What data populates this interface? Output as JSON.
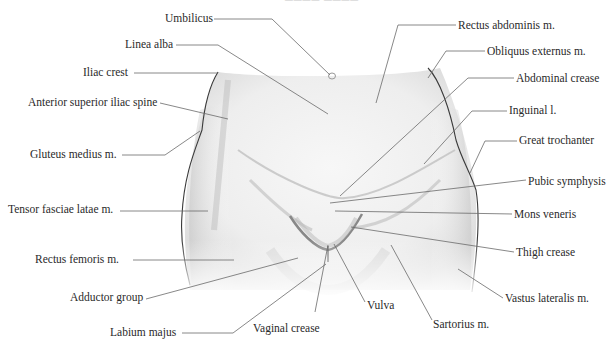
{
  "diagram": {
    "title_fragment": "──── ────",
    "colors": {
      "line": "#6a6a6a",
      "text": "#2a2a2a",
      "outline": "#3a3a3a",
      "shade": "#9a9a9a"
    },
    "labels": [
      {
        "id": "umbilicus",
        "text": "Umbilicus",
        "x": 165,
        "y": 12,
        "align": "r",
        "w": 47,
        "line": [
          [
            214,
            19
          ],
          [
            272,
            19
          ],
          [
            330,
            75
          ]
        ]
      },
      {
        "id": "linea-alba",
        "text": "Linea alba",
        "x": 125,
        "y": 38,
        "align": "r",
        "w": 50,
        "line": [
          [
            176,
            45
          ],
          [
            218,
            45
          ],
          [
            328,
            114
          ]
        ]
      },
      {
        "id": "iliac-crest",
        "text": "Iliac crest",
        "x": 83,
        "y": 66,
        "align": "r",
        "w": 45,
        "line": [
          [
            134,
            73
          ],
          [
            218,
            73
          ]
        ]
      },
      {
        "id": "asis",
        "text": "Anterior superior iliac spine",
        "x": 28,
        "y": 96,
        "align": "r",
        "w": 130,
        "line": [
          [
            160,
            103
          ],
          [
            228,
            119
          ]
        ]
      },
      {
        "id": "gluteus-medius",
        "text": "Gluteus medius m.",
        "x": 30,
        "y": 148,
        "align": "r",
        "w": 88,
        "line": [
          [
            122,
            155
          ],
          [
            165,
            155
          ],
          [
            200,
            131
          ]
        ]
      },
      {
        "id": "tensor-fasciae-latae",
        "text": "Tensor fasciae latae m.",
        "x": 8,
        "y": 203,
        "align": "r",
        "w": 108,
        "line": [
          [
            120,
            211
          ],
          [
            208,
            211
          ]
        ]
      },
      {
        "id": "rectus-femoris",
        "text": "Rectus femoris m.",
        "x": 35,
        "y": 253,
        "align": "r",
        "w": 85,
        "line": [
          [
            133,
            260
          ],
          [
            234,
            260
          ]
        ]
      },
      {
        "id": "adductor-group",
        "text": "Adductor group",
        "x": 70,
        "y": 291,
        "align": "r",
        "w": 75,
        "line": [
          [
            146,
            299
          ],
          [
            298,
            258
          ]
        ]
      },
      {
        "id": "labium-majus",
        "text": "Labium majus",
        "x": 110,
        "y": 326,
        "align": "r",
        "w": 70,
        "line": [
          [
            182,
            333
          ],
          [
            233,
            333
          ],
          [
            326,
            264
          ]
        ]
      },
      {
        "id": "vaginal-crease",
        "text": "Vaginal crease",
        "x": 253,
        "y": 322,
        "align": "l",
        "w": 75,
        "line": [
          [
            315,
            312
          ],
          [
            328,
            245
          ]
        ]
      },
      {
        "id": "vulva",
        "text": "Vulva",
        "x": 367,
        "y": 299,
        "align": "l",
        "w": 30,
        "line": [
          [
            365,
            302
          ],
          [
            334,
            244
          ]
        ]
      },
      {
        "id": "sartorius",
        "text": "Sartorius m.",
        "x": 433,
        "y": 318,
        "align": "l",
        "w": 58,
        "line": [
          [
            432,
            320
          ],
          [
            391,
            245
          ]
        ]
      },
      {
        "id": "vastus-lateralis",
        "text": "Vastus lateralis m.",
        "x": 505,
        "y": 292,
        "align": "l",
        "w": 95,
        "line": [
          [
            503,
            298
          ],
          [
            458,
            269
          ]
        ]
      },
      {
        "id": "thigh-crease",
        "text": "Thigh crease",
        "x": 516,
        "y": 246,
        "align": "l",
        "w": 65,
        "line": [
          [
            514,
            252
          ],
          [
            351,
            227
          ]
        ]
      },
      {
        "id": "mons-veneris",
        "text": "Mons veneris",
        "x": 514,
        "y": 208,
        "align": "l",
        "w": 66,
        "line": [
          [
            512,
            214
          ],
          [
            335,
            211
          ]
        ]
      },
      {
        "id": "pubic-symphysis",
        "text": "Pubic symphysis",
        "x": 528,
        "y": 175,
        "align": "l",
        "w": 82,
        "line": [
          [
            526,
            180
          ],
          [
            330,
            203
          ]
        ]
      },
      {
        "id": "great-trochanter",
        "text": "Great trochanter",
        "x": 519,
        "y": 134,
        "align": "l",
        "w": 84,
        "line": [
          [
            517,
            141
          ],
          [
            485,
            141
          ],
          [
            470,
            173
          ]
        ]
      },
      {
        "id": "inguinal-l",
        "text": "Inguinal l.",
        "x": 509,
        "y": 104,
        "align": "l",
        "w": 55,
        "line": [
          [
            507,
            111
          ],
          [
            472,
            111
          ],
          [
            424,
            164
          ]
        ]
      },
      {
        "id": "abdominal-crease",
        "text": "Abdominal crease",
        "x": 516,
        "y": 72,
        "align": "l",
        "w": 90,
        "line": [
          [
            514,
            78
          ],
          [
            468,
            78
          ],
          [
            340,
            196
          ]
        ]
      },
      {
        "id": "obliquus-externus",
        "text": "Obliquus externus m.",
        "x": 487,
        "y": 45,
        "align": "l",
        "w": 105,
        "line": [
          [
            485,
            51
          ],
          [
            446,
            51
          ],
          [
            428,
            78
          ]
        ]
      },
      {
        "id": "rectus-abdominis",
        "text": "Rectus abdominis m.",
        "x": 458,
        "y": 19,
        "align": "l",
        "w": 105,
        "line": [
          [
            456,
            25
          ],
          [
            398,
            25
          ],
          [
            376,
            103
          ]
        ]
      }
    ]
  }
}
